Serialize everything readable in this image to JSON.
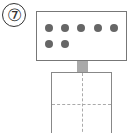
{
  "problem": {
    "number_label": "⑦",
    "number": 7
  },
  "card": {
    "dot_count": 7,
    "dot_color": "#666666",
    "rows": [
      {
        "dots": 5
      },
      {
        "dots": 2
      }
    ]
  },
  "answer_box": {
    "value": "",
    "grid": "2x2 dashed guide"
  }
}
